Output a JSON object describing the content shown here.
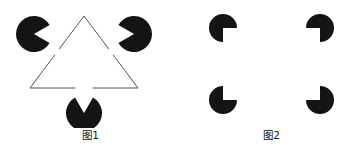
{
  "page": {
    "background_color": "#ffffff",
    "width": 362,
    "height": 156,
    "ink_color": "#141414",
    "line_color": "#555555"
  },
  "figures": [
    {
      "id": "fig1",
      "caption": "图1",
      "illusion_name": "Kanizsa triangle",
      "description": "Three black pac-man inducers at the corners of an upward-pointing illusory triangle, plus an outlined downward-pointing triangle whose sides are interrupted.",
      "inducers": [
        {
          "name": "pacman-top-left",
          "cx": 34,
          "cy": 34,
          "r": 18,
          "wedge_start_deg": -30,
          "wedge_end_deg": 30,
          "fill": "#141414"
        },
        {
          "name": "pacman-top-right",
          "cx": 134,
          "cy": 34,
          "r": 18,
          "wedge_start_deg": 150,
          "wedge_end_deg": 210,
          "fill": "#141414"
        },
        {
          "name": "pacman-bottom",
          "cx": 84,
          "cy": 113,
          "r": 18,
          "wedge_start_deg": 240,
          "wedge_end_deg": 300,
          "fill": "#141414"
        }
      ],
      "outline_triangle": {
        "name": "outlined-downward-triangle",
        "stroke": "#555555",
        "stroke_width": 1,
        "vertices": [
          {
            "x": 84,
            "y": 16
          },
          {
            "x": 30,
            "y": 88
          },
          {
            "x": 138,
            "y": 88
          }
        ],
        "gaps": "each side interrupted near its midpoint by the illusory upward triangle"
      }
    },
    {
      "id": "fig2",
      "caption": "图2",
      "illusion_name": "Kanizsa square",
      "description": "Four black pac-man inducers, each missing a 90-degree quadrant that faces the centre, forming an illusory square.",
      "inducers": [
        {
          "name": "pacman-top-left",
          "cx": 42,
          "cy": 28,
          "r": 14,
          "wedge_start_deg": 0,
          "wedge_end_deg": 90,
          "fill": "#141414"
        },
        {
          "name": "pacman-top-right",
          "cx": 139,
          "cy": 28,
          "r": 14,
          "wedge_start_deg": 90,
          "wedge_end_deg": 180,
          "fill": "#141414"
        },
        {
          "name": "pacman-bottom-left",
          "cx": 42,
          "cy": 100,
          "r": 14,
          "wedge_start_deg": 270,
          "wedge_end_deg": 360,
          "fill": "#141414"
        },
        {
          "name": "pacman-bottom-right",
          "cx": 139,
          "cy": 100,
          "r": 14,
          "wedge_start_deg": 180,
          "wedge_end_deg": 270,
          "fill": "#141414"
        }
      ]
    }
  ]
}
